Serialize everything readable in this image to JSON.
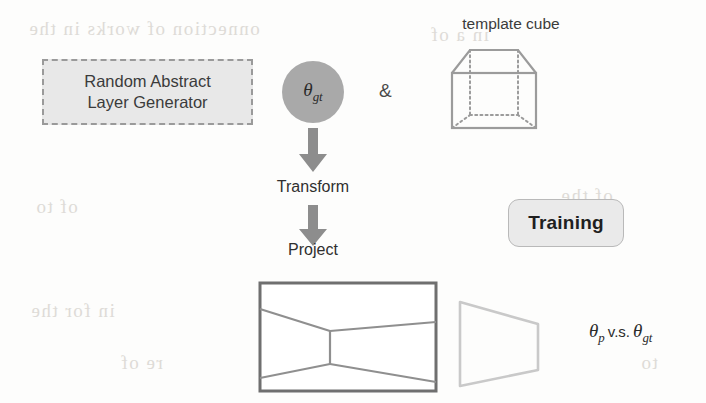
{
  "figure": {
    "name": "synthetic-layout-training-pipeline",
    "background_color": "#fdfdfc"
  },
  "generator_box": {
    "line1": "Random Abstract",
    "line2": "Layer Generator",
    "fill_color": "#e8e8e8",
    "border_color": "#9a9a9a",
    "border_style": "dashed"
  },
  "theta_node": {
    "symbol": "θ",
    "subscript": "gt",
    "fill_color": "#a9a9a9",
    "shape": "circle"
  },
  "conjunction": {
    "label": "&"
  },
  "template_cube": {
    "label": "template cube",
    "stroke_color": "#9b9b9b",
    "hidden_edge_style": "dotted"
  },
  "steps": [
    {
      "label": "Transform",
      "arrow": "down-block-arrow"
    },
    {
      "label": "Project",
      "arrow": "down-block-arrow"
    }
  ],
  "training_box": {
    "label": "Training",
    "fill_color": "#eaeaea",
    "border_color": "#b9b9b9"
  },
  "projected_room": {
    "name": "projected-room-view",
    "stroke_color": "#8f8f8f",
    "border_color": "#6f6f6f"
  },
  "predicted_shape": {
    "name": "predicted-layout-trapezoid",
    "stroke_color": "#c9c9c9"
  },
  "comparison": {
    "symbol_left": "θ",
    "subscript_left": "p",
    "operator": "v.s.",
    "symbol_right": "θ",
    "subscript_right": "gt"
  },
  "ghost_text": [
    {
      "text": "onnection of works in the",
      "left": 28,
      "top": 18
    },
    {
      "text": "in a of",
      "left": 430,
      "top": 24
    },
    {
      "text": "of the",
      "left": 560,
      "top": 185
    },
    {
      "text": "of to",
      "left": 35,
      "top": 196
    },
    {
      "text": "in for the",
      "left": 30,
      "top": 300
    },
    {
      "text": "re of",
      "left": 120,
      "top": 352
    },
    {
      "text": "to",
      "left": 640,
      "top": 352
    }
  ]
}
